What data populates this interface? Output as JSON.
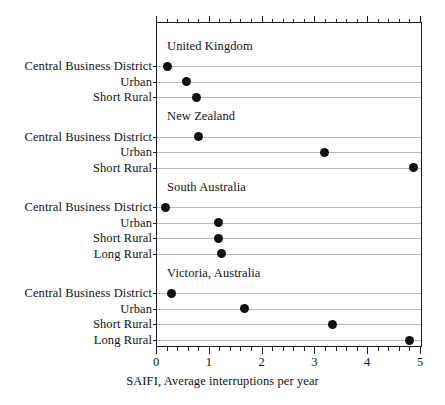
{
  "chart_data": {
    "type": "scatter",
    "subtype": "cleveland-dot-plot",
    "title": "",
    "xlabel": "SAIFI, Average interruptions per year",
    "ylabel": "",
    "xlim": [
      0,
      5
    ],
    "ylim": [
      0,
      1
    ],
    "grid": true,
    "legend": null,
    "x_ticks": [
      0,
      1,
      2,
      3,
      4,
      5
    ],
    "x_tick_labels": [
      "0",
      "1",
      "2",
      "3",
      "4",
      "5"
    ],
    "x_minor_tick_step": 0.2,
    "marker": "filled-circle",
    "marker_color": "#111111",
    "gridline_color": "#b8b8b8",
    "axis_color": "#1a1a1a",
    "panels": [
      {
        "name": "United Kingdom",
        "categories": [
          "Central Business District",
          "Urban",
          "Short Rural"
        ],
        "values": [
          0.2,
          0.56,
          0.75
        ]
      },
      {
        "name": "New Zealand",
        "categories": [
          "Central Business District",
          "Urban",
          "Short Rural"
        ],
        "values": [
          0.78,
          3.18,
          4.85
        ]
      },
      {
        "name": "South Australia",
        "categories": [
          "Central Business District",
          "Urban",
          "Short Rural",
          "Long Rural"
        ],
        "values": [
          0.16,
          1.17,
          1.16,
          1.22
        ]
      },
      {
        "name": "Victoria, Australia",
        "categories": [
          "Central Business District",
          "Urban",
          "Short Rural",
          "Long Rural"
        ],
        "values": [
          0.28,
          1.65,
          3.32,
          4.79
        ]
      }
    ]
  },
  "figure": {
    "xaxis_title": "SAIFI, Average interruptions per year",
    "panel_titles": [
      "United Kingdom",
      "New Zealand",
      "South Australia",
      "Victoria, Australia"
    ],
    "tick_labels": [
      "0",
      "1",
      "2",
      "3",
      "4",
      "5"
    ],
    "category_labels": [
      "Central Business District",
      "Urban",
      "Short Rural",
      "Central Business District",
      "Urban",
      "Short Rural",
      "Central Business District",
      "Urban",
      "Short Rural",
      "Long Rural",
      "Central Business District",
      "Urban",
      "Short Rural",
      "Long Rural"
    ]
  }
}
